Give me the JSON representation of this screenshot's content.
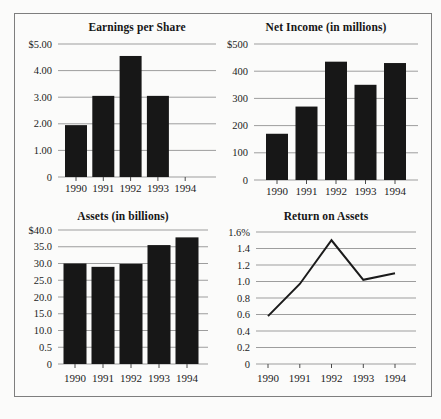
{
  "page": {
    "background": "#fbfbfa",
    "frame_border_color": "#7e7e7e",
    "text_color": "#1c1c1c",
    "tick_color": "#4a4a4a"
  },
  "chart_data": [
    {
      "id": "earnings-per-share",
      "type": "bar",
      "title": "Earnings per Share",
      "categories": [
        "1990",
        "1991",
        "1992",
        "1993",
        "1994"
      ],
      "values": [
        1.95,
        3.05,
        4.55,
        3.05,
        null
      ],
      "y_ticks": [
        "$5.00",
        "4.00",
        "3.00",
        "2.00",
        "1.00",
        "0"
      ],
      "y_min": 0,
      "y_max": 5,
      "grid": true,
      "legend": "none",
      "bar_color": "#171717",
      "grid_color": "#9d9d9d"
    },
    {
      "id": "net-income",
      "type": "bar",
      "title": "Net Income (in millions)",
      "categories": [
        "1990",
        "1991",
        "1992",
        "1993",
        "1994"
      ],
      "values": [
        170,
        270,
        435,
        350,
        430
      ],
      "y_ticks": [
        "$500",
        "400",
        "300",
        "200",
        "100",
        "0"
      ],
      "y_min": 0,
      "y_max": 500,
      "grid": true,
      "legend": "none",
      "bar_color": "#171717",
      "grid_color": "#9d9d9d"
    },
    {
      "id": "assets",
      "type": "bar",
      "title": "Assets (in billions)",
      "categories": [
        "1990",
        "1991",
        "1992",
        "1993",
        "1994"
      ],
      "values": [
        30.0,
        29.0,
        29.9,
        35.5,
        37.8
      ],
      "y_ticks": [
        "$40.0",
        "35.0",
        "30.0",
        "25.0",
        "20.0",
        "15.0",
        "10.0",
        "0.5",
        "0"
      ],
      "y_min": 0,
      "y_max": 40,
      "grid": true,
      "legend": "none",
      "bar_color": "#171717",
      "grid_color": "#9d9d9d"
    },
    {
      "id": "return-on-assets",
      "type": "line",
      "title": "Return on Assets",
      "categories": [
        "1990",
        "1991",
        "1992",
        "1993",
        "1994"
      ],
      "values": [
        0.58,
        0.97,
        1.5,
        1.02,
        1.1
      ],
      "y_ticks": [
        "1.6%",
        "1.4",
        "1.2",
        "1.0",
        "0.8",
        "0.6",
        "0.4",
        "0.2",
        "0"
      ],
      "y_min": 0,
      "y_max": 1.6,
      "grid": true,
      "legend": "none",
      "line_color": "#1b1b1b",
      "grid_color": "#9d9d9d"
    }
  ]
}
